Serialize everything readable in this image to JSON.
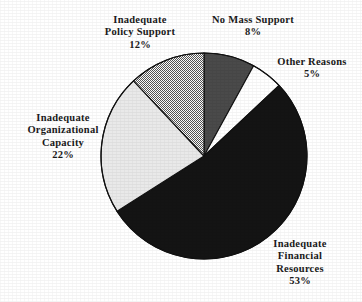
{
  "chart_data": {
    "type": "pie",
    "title": "",
    "subtitle": "",
    "xlabel": "",
    "ylabel": "",
    "legend_position": "none",
    "grid": false,
    "labels_show_percent": true,
    "total_percent": 100,
    "center": {
      "x": 204,
      "y": 156
    },
    "radius": 103,
    "start_angle_deg": 0,
    "direction": "clockwise",
    "categories": [
      "No Mass Support",
      "Other Reasons",
      "Inadequate Financial Resources",
      "Inadequate Organizational Capacity",
      "Inadequate Policy Support"
    ],
    "values": [
      8,
      5,
      53,
      22,
      12
    ],
    "slices": [
      {
        "label": "No Mass Support",
        "value": 8,
        "percent_text": "8%",
        "fill": "#4a4a4a",
        "fill_style": "solid-dark-gray",
        "stroke": "#111111"
      },
      {
        "label": "Other Reasons",
        "value": 5,
        "percent_text": "5%",
        "fill": "#ffffff",
        "fill_style": "solid-white",
        "stroke": "#111111"
      },
      {
        "label": "Inadequate Financial Resources",
        "value": 53,
        "percent_text": "53%",
        "fill": "#141414",
        "fill_style": "solid-black",
        "stroke": "#111111"
      },
      {
        "label": "Inadequate Organizational Capacity",
        "value": 22,
        "percent_text": "22%",
        "fill": "#e9e9e9",
        "fill_style": "solid-light-gray",
        "stroke": "#111111"
      },
      {
        "label": "Inadequate Policy Support",
        "value": 12,
        "percent_text": "12%",
        "fill": "#b4b4b4",
        "fill_style": "checkered-dither",
        "stroke": "#111111"
      }
    ]
  },
  "labels": {
    "policy": {
      "line1": "Inadequate",
      "line2": "Policy Support",
      "percent": "12%"
    },
    "mass": {
      "line1": "No Mass Support",
      "percent": "8%"
    },
    "other": {
      "line1": "Other Reasons",
      "percent": "5%"
    },
    "organizational": {
      "line1": "Inadequate",
      "line2": "Organizational",
      "line3": "Capacity",
      "percent": "22%"
    },
    "financial": {
      "line1": "Inadequate",
      "line2": "Financial",
      "line3": "Resources",
      "percent": "53%"
    }
  },
  "colors": {
    "background": "#ffffff",
    "text": "#1a1a1a",
    "outline": "#111111",
    "slice_black": "#141414",
    "slice_dark_gray": "#4a4a4a",
    "slice_light_gray": "#e9e9e9",
    "slice_white": "#ffffff",
    "slice_dither": "#b4b4b4"
  }
}
